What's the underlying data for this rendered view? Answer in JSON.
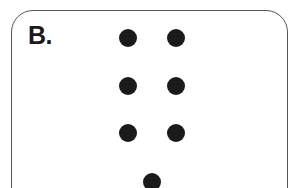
{
  "figure": {
    "panel_label": "B.",
    "panel": {
      "shape": "rounded-rectangle",
      "border_color": "#54565a",
      "fill_color": "#ffffff",
      "corner_radius_px": 22,
      "left_px": 11,
      "top_px": 10,
      "width_px": 277,
      "height_px": 210,
      "cropped_at_bottom": true
    },
    "background_color": "#ffffff",
    "dot_color": "#1a1a1a",
    "dot_count": 7,
    "dot_diameter_px": 18,
    "dots": [
      {
        "name": "dot-row1-left",
        "row": 1,
        "column": "left",
        "cx": 128,
        "cy": 38,
        "r": 9
      },
      {
        "name": "dot-row1-right",
        "row": 1,
        "column": "right",
        "cx": 176,
        "cy": 38,
        "r": 9
      },
      {
        "name": "dot-row2-left",
        "row": 2,
        "column": "left",
        "cx": 128,
        "cy": 86,
        "r": 9
      },
      {
        "name": "dot-row2-right",
        "row": 2,
        "column": "right",
        "cx": 176,
        "cy": 86,
        "r": 9
      },
      {
        "name": "dot-row3-left",
        "row": 3,
        "column": "left",
        "cx": 128,
        "cy": 133,
        "r": 9
      },
      {
        "name": "dot-row3-right",
        "row": 3,
        "column": "right",
        "cx": 176,
        "cy": 133,
        "r": 9
      },
      {
        "name": "dot-row4-center",
        "row": 4,
        "column": "center",
        "cx": 152,
        "cy": 182,
        "r": 9
      }
    ]
  }
}
